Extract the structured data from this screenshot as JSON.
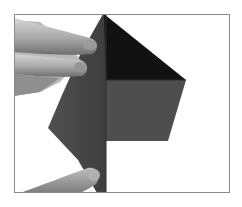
{
  "image": {
    "description": "Origami folding step: hands hold a dark gray paper with a black triangular fold at top and a gray flap folded to the right",
    "frame_color": "#8a8a8a",
    "background_color": "#ffffff",
    "colors": {
      "paper_strip": "#474747",
      "dark_triangle": "#121212",
      "flap": "#4e4e4e",
      "skin_light": "#c9c9c9",
      "skin_mid": "#a8a8a8",
      "skin_shadow": "#7a7a7a"
    }
  }
}
